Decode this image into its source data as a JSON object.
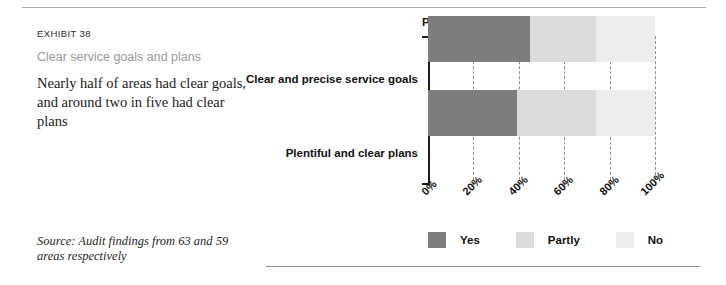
{
  "exhibit": {
    "label": "EXHIBIT 38",
    "subtitle": "Clear service goals and plans",
    "description": "Nearly half of areas had clear goals, and around two in five had clear plans",
    "source": "Source: Audit findings from 63 and 59 areas respectively"
  },
  "chart_data": {
    "type": "bar",
    "orientation": "horizontal",
    "stacked": true,
    "stack_mode": "percent",
    "title": "Percentage of areas",
    "xlabel": "",
    "ylabel": "",
    "xlim": [
      0,
      100
    ],
    "xticks": [
      0,
      20,
      40,
      60,
      80,
      100
    ],
    "xtick_labels": [
      "0%",
      "20%",
      "40%",
      "60%",
      "80%",
      "100%"
    ],
    "grid": "vertical-dashed",
    "legend_position": "bottom-left",
    "categories": [
      "Clear and precise service goals",
      "Plentiful and clear plans"
    ],
    "series": [
      {
        "name": "Yes",
        "color": "#7d7d7d",
        "values": [
          45,
          39
        ]
      },
      {
        "name": "Partly",
        "color": "#dcdcdc",
        "values": [
          29,
          35
        ]
      },
      {
        "name": "No",
        "color": "#ededed",
        "values": [
          26,
          26
        ]
      }
    ]
  },
  "colors": {
    "yes": "#7d7d7d",
    "partly": "#dcdcdc",
    "no": "#ededed",
    "rule": "#adadad",
    "subtitle": "#9a9a9a"
  }
}
